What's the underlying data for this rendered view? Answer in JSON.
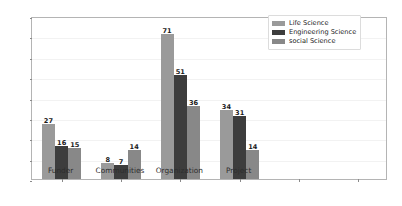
{
  "chart_data": {
    "type": "bar",
    "title": "",
    "xlabel": "",
    "ylabel": "",
    "ylim": [
      0,
      80
    ],
    "ytick_labels": [
      "0",
      "10",
      "20",
      "30",
      "40",
      "50",
      "60",
      "70",
      "80"
    ],
    "yticks": [
      0,
      10,
      20,
      30,
      40,
      50,
      60,
      70,
      80
    ],
    "grid": true,
    "legend_position": "upper right",
    "categories": [
      "Funder",
      "Communities",
      "Organization",
      "Project"
    ],
    "series": [
      {
        "name": "Life Science",
        "color": "#9a9a9a",
        "values": [
          27,
          8,
          71,
          34
        ]
      },
      {
        "name": "Engineering Science",
        "color": "#3d3d3d",
        "values": [
          16,
          7,
          51,
          31
        ]
      },
      {
        "name": "social Science",
        "color": "#888888",
        "values": [
          15,
          14,
          36,
          14
        ]
      }
    ],
    "extra_unlabeled_xticks": 2
  },
  "colors": {
    "figure_background": "#ffffff",
    "axes_background": "#ffffff",
    "axes_border": "#b4b4b4",
    "gridline": "#f2f2f2",
    "tick_mark": "#8a8a8a",
    "tick_text": "#3a3a3a",
    "value_label_text": "#1a1a1a",
    "legend_border": "#dcdcdc",
    "legend_background": "#ffffff"
  }
}
